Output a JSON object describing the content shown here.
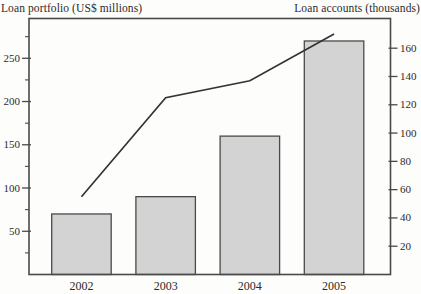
{
  "figure": {
    "kind": "combo bar and line chart, scanned print style"
  },
  "chart_data": {
    "type": "bar",
    "categories": [
      "2002",
      "2003",
      "2004",
      "2005"
    ],
    "series": [
      {
        "name": "Loan portfolio",
        "type": "bar",
        "axis": "left",
        "values": [
          70,
          90,
          160,
          270
        ]
      },
      {
        "name": "Loan accounts",
        "type": "line",
        "axis": "right",
        "values": [
          55,
          125,
          137,
          170
        ]
      }
    ],
    "left_axis": {
      "title": "Loan portfolio (US$ millions)",
      "tick_values": [
        50,
        100,
        150,
        200,
        250
      ],
      "minor_tick_step": 25,
      "range": [
        0,
        296
      ]
    },
    "right_axis": {
      "title": "Loan accounts (thousands)",
      "tick_values": [
        20,
        40,
        60,
        80,
        100,
        120,
        140,
        160
      ],
      "range": [
        0,
        181
      ]
    },
    "grid": false,
    "legend": "none",
    "colors": {
      "bar_fill": "#d3d3d3",
      "bar_border": "#4a4a4a",
      "line": "#333333",
      "frame": "#4a4a4a",
      "text": "#2b2b2b",
      "background": "#fdfdfc"
    }
  }
}
